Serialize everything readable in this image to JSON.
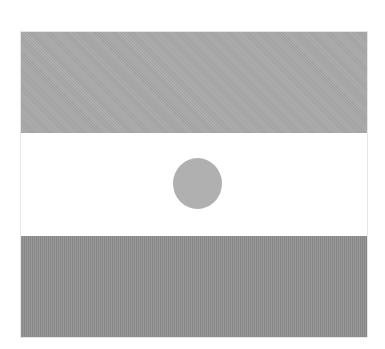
{
  "image": {
    "description": "Grayscale horizontal tricolour flag with a central disc",
    "bands": [
      {
        "position": "top",
        "color": "#a9a9a9"
      },
      {
        "position": "middle",
        "color": "#ffffff"
      },
      {
        "position": "bottom",
        "color": "#8f8f8f"
      }
    ],
    "emblem": {
      "shape": "circle",
      "color": "#b0b0b0"
    }
  }
}
